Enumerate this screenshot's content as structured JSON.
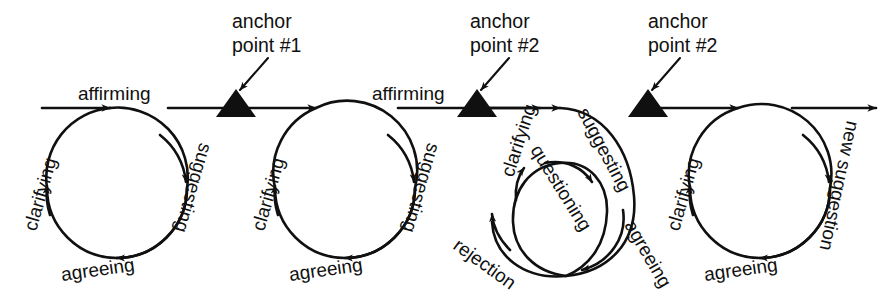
{
  "figure": {
    "background_color": "#ffffff",
    "ink_color": "#101010",
    "width": 881,
    "height": 307
  },
  "timeline": {
    "baseline_y": 108,
    "start_x": 42,
    "end_x": 876,
    "direction": "left-to-right"
  },
  "anchors": [
    {
      "id": "anchor-1",
      "line1": "anchor",
      "line2": "point #1",
      "x": 236,
      "label_x": 232,
      "label_y": 28
    },
    {
      "id": "anchor-2",
      "line1": "anchor",
      "line2": "point #2",
      "x": 477,
      "label_x": 470,
      "label_y": 28
    },
    {
      "id": "anchor-3",
      "line1": "anchor",
      "line2": "point #2",
      "x": 648,
      "label_x": 648,
      "label_y": 28
    }
  ],
  "segment_labels": [
    {
      "id": "affirming-1",
      "text": "affirming",
      "x": 78,
      "y": 100
    },
    {
      "id": "affirming-2",
      "text": "affirming",
      "x": 372,
      "y": 100
    }
  ],
  "loops": [
    {
      "id": "loop-1",
      "cx": 117,
      "cy": 188,
      "r": 70,
      "labels": [
        {
          "id": "loop1-clarifying",
          "text": "clarifying",
          "x": 36,
          "y": 232,
          "rotate": -74
        },
        {
          "id": "loop1-suggesting",
          "text": "suggesting",
          "x": 200,
          "y": 142,
          "rotate": 106
        },
        {
          "id": "loop1-agreeing",
          "text": "agreeing",
          "x": 62,
          "y": 281,
          "rotate": -8
        }
      ]
    },
    {
      "id": "loop-2",
      "cx": 345,
      "cy": 188,
      "r": 70,
      "labels": [
        {
          "id": "loop2-clarifying",
          "text": "clarifying",
          "x": 264,
          "y": 232,
          "rotate": -74
        },
        {
          "id": "loop2-suggesting",
          "text": "suggesting",
          "x": 428,
          "y": 142,
          "rotate": 106
        },
        {
          "id": "loop2-agreeing",
          "text": "agreeing",
          "x": 290,
          "y": 281,
          "rotate": -8
        }
      ]
    },
    {
      "id": "loop-4",
      "cx": 760,
      "cy": 188,
      "r": 70,
      "labels": [
        {
          "id": "loop4-clarifying",
          "text": "clarifying",
          "x": 679,
          "y": 232,
          "rotate": -74
        },
        {
          "id": "loop4-new-suggestion",
          "text": "new suggestion",
          "x": 847,
          "y": 120,
          "rotate": 102
        },
        {
          "id": "loop4-agreeing",
          "text": "agreeing",
          "x": 705,
          "y": 281,
          "rotate": -8
        }
      ]
    }
  ],
  "spiral": {
    "id": "loop-3-spiral",
    "outer": {
      "cx": 566,
      "cy": 200,
      "rx": 70,
      "ry": 78
    },
    "inner": {
      "cx": 558,
      "cy": 205,
      "rx": 45,
      "ry": 55
    },
    "labels": [
      {
        "id": "spiral-suggesting",
        "text": "suggesting",
        "x": 577,
        "y": 112,
        "rotate": 62
      },
      {
        "id": "spiral-questioning",
        "text": "questioning",
        "x": 530,
        "y": 150,
        "rotate": 58
      },
      {
        "id": "spiral-agreeing",
        "text": "agreeing",
        "x": 624,
        "y": 225,
        "rotate": 60
      },
      {
        "id": "spiral-clarifying",
        "text": "clarifying",
        "x": 513,
        "y": 178,
        "rotate": -72
      },
      {
        "id": "spiral-rejection",
        "text": "rejection",
        "x": 452,
        "y": 248,
        "rotate": 36
      }
    ]
  }
}
